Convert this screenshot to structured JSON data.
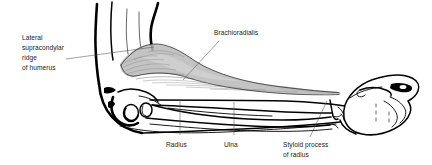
{
  "figure": {
    "background_color": "#ffffff",
    "ink_color": "#000000",
    "muscle_shade_color": "#b8b8b8",
    "leader_line_color": "#555555"
  },
  "labels": {
    "lateral_supracondylar": {
      "line1": "Lateral",
      "line2": "supracondylar",
      "line3": "ridge",
      "line4": "of humerus"
    },
    "brachioradialis": {
      "text": "Brachioradialis"
    },
    "radius": {
      "text": "Radius"
    },
    "ulna": {
      "text": "Ulna"
    },
    "styloid_process": {
      "line1": "Styloid process",
      "line2": "of radius"
    }
  },
  "structures": [
    {
      "name": "humerus-upper-arm",
      "description": "upper arm shaft shown at upper left"
    },
    {
      "name": "brachioradialis-muscle",
      "description": "shaded muscle belly from lateral supracondylar ridge to radial styloid"
    },
    {
      "name": "elbow-olecranon",
      "description": "flexed elbow contour at left"
    },
    {
      "name": "radius-bone",
      "description": "lateral forearm bone"
    },
    {
      "name": "ulna-bone",
      "description": "medial forearm bone"
    },
    {
      "name": "radial-styloid-process",
      "description": "distal bony prominence at the wrist"
    },
    {
      "name": "clenched-fist",
      "description": "closed hand at right end of forearm"
    }
  ]
}
